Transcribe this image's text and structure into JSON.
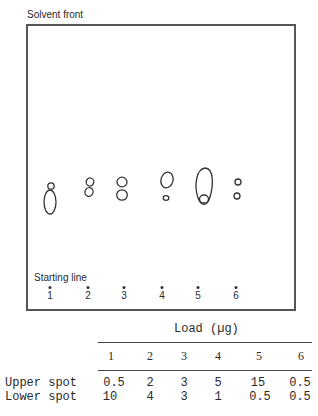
{
  "plate": {
    "solvent_front_label": "Solvent front",
    "starting_line_label": "Starting line",
    "lanes": [
      "1",
      "2",
      "3",
      "4",
      "5",
      "6"
    ]
  },
  "table": {
    "title": "Load (µg)",
    "columns": [
      "1",
      "2",
      "3",
      "4",
      "5",
      "6"
    ],
    "rows": [
      {
        "label": "Upper spot",
        "values": [
          "0.5",
          "2",
          "3",
          "5",
          "15",
          "0.5"
        ]
      },
      {
        "label": "Lower spot",
        "values": [
          "10",
          "4",
          "3",
          "1",
          "0.5",
          "0.5"
        ]
      }
    ]
  }
}
